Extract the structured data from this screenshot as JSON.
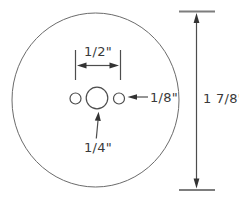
{
  "diagram": {
    "type": "technical-drawing",
    "dimensions": {
      "hole_spacing": "1/2\"",
      "side_hole_diameter": "1/8\"",
      "center_hole_diameter": "1/4\"",
      "disc_diameter": "1 7/8\""
    },
    "colors": {
      "background": "#ffffff",
      "line": "#4d4d4d",
      "disc_outline": "#6b6b6b",
      "text": "#3a3a3a",
      "arrowhead": "#333333"
    }
  }
}
